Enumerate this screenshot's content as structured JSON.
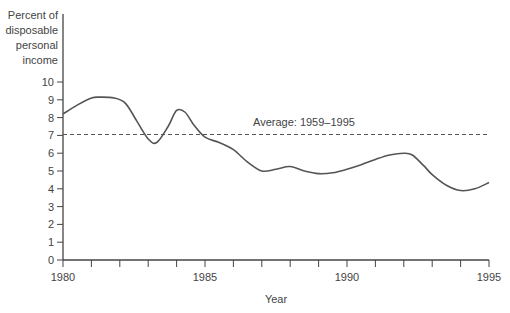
{
  "chart_data": {
    "type": "line",
    "title": "",
    "ylabel_lines": [
      "Percent of",
      "disposable",
      "personal",
      "income"
    ],
    "xlabel": "Year",
    "xlim": [
      1980,
      1995
    ],
    "ylim": [
      0,
      10
    ],
    "x_tick_labels": [
      "1980",
      "1985",
      "1990",
      "1995"
    ],
    "x_minor_ticks": [
      1980,
      1981,
      1982,
      1983,
      1984,
      1985,
      1986,
      1987,
      1988,
      1989,
      1990,
      1991,
      1992,
      1993,
      1994,
      1995
    ],
    "y_ticks": [
      0,
      1,
      2,
      3,
      4,
      5,
      6,
      7,
      8,
      9,
      10
    ],
    "grid": false,
    "series": [
      {
        "name": "Personal saving rate",
        "x": [
          1980,
          1980.5,
          1981,
          1981.3,
          1981.8,
          1982.2,
          1982.6,
          1983,
          1983.3,
          1983.7,
          1984,
          1984.3,
          1984.6,
          1985,
          1985.5,
          1986,
          1986.5,
          1987,
          1987.5,
          1988,
          1988.5,
          1989,
          1989.5,
          1990,
          1990.5,
          1991,
          1991.5,
          1992,
          1992.3,
          1992.7,
          1993,
          1993.5,
          1994,
          1994.5,
          1995
        ],
        "values": [
          8.2,
          8.7,
          9.1,
          9.15,
          9.1,
          8.8,
          7.8,
          6.8,
          6.6,
          7.5,
          8.4,
          8.3,
          7.6,
          6.9,
          6.6,
          6.2,
          5.5,
          5.0,
          5.1,
          5.25,
          5.0,
          4.85,
          4.9,
          5.1,
          5.35,
          5.65,
          5.9,
          6.0,
          5.9,
          5.3,
          4.8,
          4.2,
          3.9,
          4.0,
          4.35
        ]
      }
    ],
    "reference_line": {
      "label": "Average: 1959–1995",
      "value": 7.05,
      "style": "dashed"
    }
  }
}
